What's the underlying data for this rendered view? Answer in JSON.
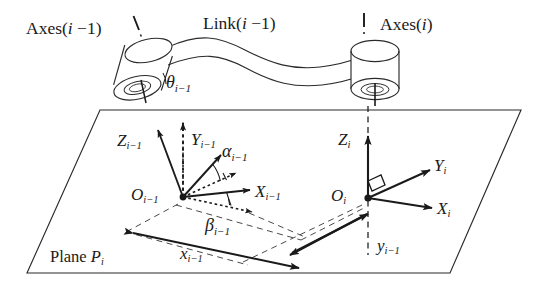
{
  "figure": {
    "background_color": "#ffffff",
    "stroke_color": "#1a1a1a",
    "width": 548,
    "height": 291
  },
  "labels": {
    "axes_prev": {
      "text": "Axes(i −1)",
      "base": "Axes(",
      "var": "i",
      "suffix": " −1)"
    },
    "axes_curr": {
      "text": "Axes(i)",
      "base": "Axes(",
      "var": "i",
      "suffix": ")"
    },
    "link_prev": {
      "text": "Link(i −1)",
      "base": "Link(",
      "var": "i",
      "suffix": " −1)"
    },
    "theta_prev": {
      "symbol": "θ",
      "sub": "i−1"
    },
    "alpha_prev": {
      "symbol": "α",
      "sub": "i−1"
    },
    "beta_prev": {
      "symbol": "β",
      "sub": "i−1"
    },
    "z_prev": {
      "symbol": "Z",
      "sub": "i−1"
    },
    "y_prev": {
      "symbol": "Y",
      "sub": "i−1"
    },
    "x_prev": {
      "symbol": "X",
      "sub": "i−1"
    },
    "o_prev": {
      "symbol": "O",
      "sub": "i−1"
    },
    "z_curr": {
      "symbol": "Z",
      "sub": "i"
    },
    "y_curr": {
      "symbol": "Y",
      "sub": "i"
    },
    "x_curr": {
      "symbol": "X",
      "sub": "i"
    },
    "o_curr": {
      "symbol": "O",
      "sub": "i"
    },
    "x_offset": {
      "symbol": "x",
      "sub": "i−1"
    },
    "y_offset": {
      "symbol": "y",
      "sub": "i−1"
    },
    "plane": {
      "prefix": "Plane ",
      "symbol": "P",
      "sub": "i"
    }
  },
  "geometry": {
    "plane_corners": [
      [
        100,
        110
      ],
      [
        521,
        110
      ],
      [
        450,
        273
      ],
      [
        27,
        273
      ]
    ],
    "origin_prev": [
      183,
      197
    ],
    "origin_curr": [
      368,
      198
    ],
    "joint_prev_center": [
      141,
      86
    ],
    "joint_curr_center": [
      375,
      78
    ]
  },
  "icon_names": [
    "cylinder-joint-icon",
    "curved-link-icon",
    "axis-arrow-icon",
    "angle-arc-icon",
    "dashed-axis-icon",
    "right-angle-marker-icon"
  ]
}
